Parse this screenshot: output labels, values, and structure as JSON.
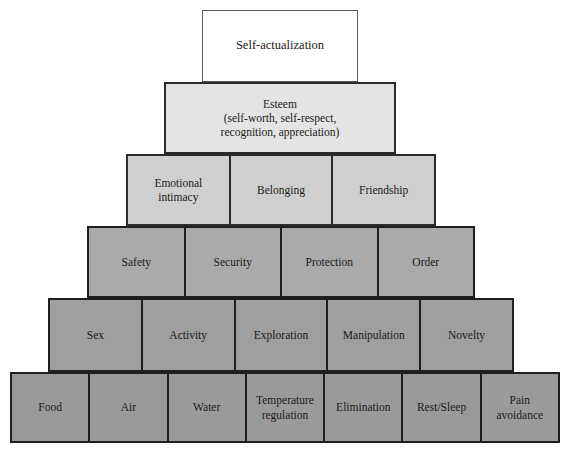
{
  "diagram": {
    "type": "stepped-pyramid",
    "tiers": [
      {
        "level": 1,
        "name": "self-actualization",
        "fill": "#ffffff",
        "cells": [
          {
            "label": "Self-actualization"
          }
        ]
      },
      {
        "level": 2,
        "name": "esteem",
        "fill": "#e4e4e4",
        "cells": [
          {
            "label": "Esteem",
            "line1": "Esteem",
            "line2": "(self-worth, self-respect,",
            "line3": "recognition, appreciation)"
          }
        ]
      },
      {
        "level": 3,
        "name": "love-and-belonging",
        "fill": "#cfcfcf",
        "cells": [
          {
            "line1": "Emotional",
            "line2": "intimacy"
          },
          {
            "line1": "Belonging",
            "line2": ""
          },
          {
            "line1": "Friendship",
            "line2": ""
          }
        ]
      },
      {
        "level": 4,
        "name": "safety",
        "fill": "#aaaaaa",
        "cells": [
          {
            "label": "Safety"
          },
          {
            "label": "Security"
          },
          {
            "label": "Protection"
          },
          {
            "label": "Order"
          }
        ]
      },
      {
        "level": 5,
        "name": "stimulation",
        "fill": "#9f9f9f",
        "cells": [
          {
            "label": "Sex"
          },
          {
            "label": "Activity"
          },
          {
            "label": "Exploration"
          },
          {
            "label": "Manipulation"
          },
          {
            "label": "Novelty"
          }
        ]
      },
      {
        "level": 6,
        "name": "physiological",
        "fill": "#9a9a9a",
        "cells": [
          {
            "line1": "Food",
            "line2": ""
          },
          {
            "line1": "Air",
            "line2": ""
          },
          {
            "line1": "Water",
            "line2": ""
          },
          {
            "line1": "Temperature",
            "line2": "regulation"
          },
          {
            "line1": "Elimination",
            "line2": ""
          },
          {
            "line1": "Rest/Sleep",
            "line2": ""
          },
          {
            "line1": "Pain",
            "line2": "avoidance"
          }
        ]
      }
    ]
  }
}
